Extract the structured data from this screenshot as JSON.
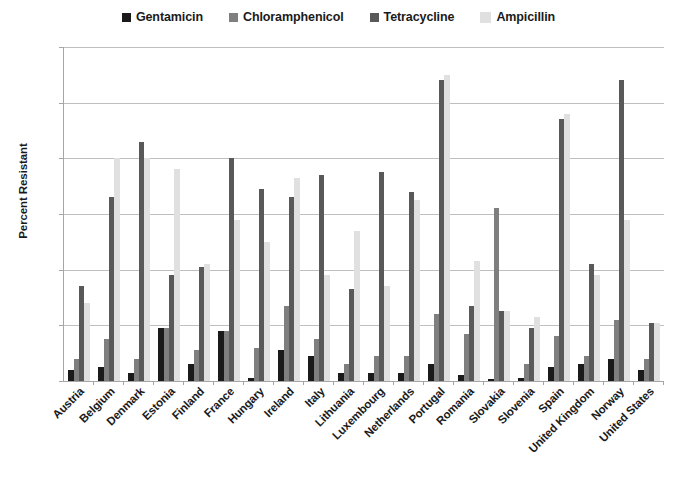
{
  "chart_data": {
    "type": "bar",
    "title": "",
    "xlabel": "",
    "ylabel": "Percent Resistant",
    "ylim": [
      0,
      60
    ],
    "ytick_labels": [
      "0%",
      "10%",
      "20%",
      "30%",
      "40%",
      "50%",
      "60%"
    ],
    "ytick_values": [
      0,
      10,
      20,
      30,
      40,
      50,
      60
    ],
    "grid": true,
    "legend_position": "top",
    "categories": [
      "Austria",
      "Belgium",
      "Denmark",
      "Estonia",
      "Finland",
      "France",
      "Hungary",
      "Ireland",
      "Italy",
      "Lithuania",
      "Luxembourg",
      "Netherlands",
      "Portugal",
      "Romania",
      "Slovakia",
      "Slovenia",
      "Spain",
      "United Kingdom",
      "Norway",
      "United States"
    ],
    "series": [
      {
        "name": "Gentamicin",
        "color": "#1a1a1a",
        "values": [
          2.0,
          2.5,
          1.5,
          9.5,
          3.0,
          9.0,
          0.5,
          5.5,
          4.5,
          1.5,
          1.5,
          1.5,
          3.0,
          1.0,
          0.3,
          0.5,
          2.5,
          3.0,
          4.0,
          2.0
        ]
      },
      {
        "name": "Chloramphenicol",
        "color": "#7f7f7f",
        "values": [
          4.0,
          7.5,
          4.0,
          9.5,
          5.5,
          9.0,
          6.0,
          13.5,
          7.5,
          3.0,
          4.5,
          4.5,
          12.0,
          8.5,
          31.0,
          3.0,
          8.0,
          4.5,
          11.0,
          4.0
        ]
      },
      {
        "name": "Tetracycline",
        "color": "#595959",
        "values": [
          17.0,
          33.0,
          43.0,
          19.0,
          20.5,
          40.0,
          34.5,
          33.0,
          37.0,
          16.5,
          37.5,
          34.0,
          54.0,
          13.5,
          12.5,
          9.5,
          47.0,
          21.0,
          54.0,
          10.5
        ]
      },
      {
        "name": "Ampicillin",
        "color": "#e0e0e0",
        "values": [
          14.0,
          40.0,
          40.0,
          38.0,
          21.0,
          29.0,
          25.0,
          36.5,
          19.0,
          27.0,
          17.0,
          32.5,
          55.0,
          21.5,
          12.5,
          11.5,
          48.0,
          19.0,
          29.0,
          10.5
        ]
      }
    ]
  }
}
